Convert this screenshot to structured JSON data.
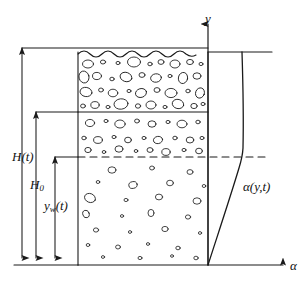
{
  "figure": {
    "width": 306,
    "height": 285,
    "background": "#ffffff",
    "ink_color": "#1a1a1a"
  },
  "axes": {
    "y_axis": {
      "label": "y",
      "x": 208,
      "top": 18,
      "bottom": 265,
      "arrow": "up"
    },
    "alpha_axis": {
      "label": "α",
      "y": 265,
      "left": 78,
      "right": 288,
      "arrow": "right"
    },
    "origin": {
      "x": 208,
      "y": 265
    }
  },
  "column": {
    "name": "foam-column",
    "left": 78,
    "right": 208,
    "top": 52,
    "bottom": 265,
    "surface_style": "wavy",
    "zones": [
      {
        "name": "dense-bubble-zone",
        "top": 52,
        "bottom": 112,
        "description": "dense large bubbles"
      },
      {
        "name": "medium-bubble-zone",
        "top": 112,
        "bottom": 157,
        "description": "medium bubble density"
      },
      {
        "name": "sparse-bubble-zone",
        "top": 157,
        "bottom": 265,
        "description": "sparse small bubbles"
      }
    ],
    "dividers": [
      {
        "name": "solid-divider",
        "y": 112,
        "style": "solid"
      },
      {
        "name": "dashed-divider",
        "y": 157,
        "style": "dashed"
      }
    ]
  },
  "dimensions": [
    {
      "name": "height-total",
      "label": "H(t)",
      "symbol": "H",
      "subscript": "",
      "suffix": "(t)",
      "x": 22,
      "top": 48,
      "bottom": 265
    },
    {
      "name": "height-initial",
      "label": "H₀",
      "symbol": "H",
      "subscript": "0",
      "suffix": "",
      "x": 36,
      "top": 112,
      "bottom": 265
    },
    {
      "name": "height-wet",
      "label": "y_w(t)",
      "symbol": "y",
      "subscript": "w",
      "suffix": "(t)",
      "x": 55,
      "top": 157,
      "bottom": 265
    }
  ],
  "curve": {
    "name": "alpha-profile-curve",
    "label": "α(y,t)",
    "description": "void fraction profile alpha as a function of y and t",
    "top_reference_line": {
      "y": 52,
      "from_x": 208,
      "to_x": 272
    },
    "dashed_reference_line": {
      "y": 157,
      "from_x": 78,
      "to_x": 268
    },
    "points": [
      {
        "x": 208,
        "y": 265
      },
      {
        "x": 215,
        "y": 243
      },
      {
        "x": 223,
        "y": 215
      },
      {
        "x": 231,
        "y": 190
      },
      {
        "x": 238,
        "y": 170
      },
      {
        "x": 242,
        "y": 158
      },
      {
        "x": 243,
        "y": 130
      },
      {
        "x": 243,
        "y": 95
      },
      {
        "x": 242,
        "y": 52
      }
    ]
  },
  "labels": {
    "y_axis": "y",
    "alpha_axis": "α",
    "curve": "α(y,t)",
    "height_total": "H(t)",
    "height_initial_symbol": "H",
    "height_initial_sub": "0",
    "height_wet_symbol": "y",
    "height_wet_sub": "w",
    "height_wet_suffix": "(t)"
  }
}
